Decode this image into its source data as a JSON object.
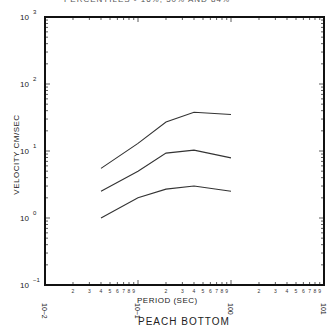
{
  "header": {
    "title_partial": "PERCENTILES - 16%, 50% AND 84%"
  },
  "footer": {
    "site_label": "PEACH BOTTOM"
  },
  "axes": {
    "xlabel": "PERIOD (SEC)",
    "ylabel": "VELOCITY CM/SEC",
    "x_ticks": [
      "10^-2",
      "10^-1",
      "10^0",
      "10^1"
    ],
    "y_ticks": [
      "10^3",
      "10^2",
      "10^1",
      "10^0",
      "10^-1"
    ]
  },
  "chart_data": {
    "type": "line",
    "title": "PERCENTILES - 16%, 50% AND 84%",
    "subtitle": "PEACH BOTTOM",
    "xlabel": "PERIOD (SEC)",
    "ylabel": "VELOCITY CM/SEC",
    "xscale": "log",
    "yscale": "log",
    "xlim": [
      0.01,
      10
    ],
    "ylim": [
      0.1,
      1000
    ],
    "grid": false,
    "legend": "none",
    "x": [
      0.04,
      0.1,
      0.2,
      0.4,
      1.0
    ],
    "series": [
      {
        "name": "84th percentile",
        "values": [
          5.5,
          13,
          27,
          38,
          35
        ]
      },
      {
        "name": "50th percentile",
        "values": [
          2.5,
          5.0,
          9.3,
          10.3,
          7.9
        ]
      },
      {
        "name": "16th percentile",
        "values": [
          1.0,
          2.0,
          2.7,
          3.0,
          2.5
        ]
      }
    ]
  }
}
